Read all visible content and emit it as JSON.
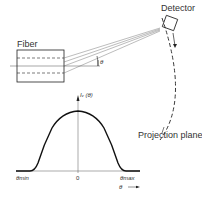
{
  "diagram": {
    "labels": {
      "fiber": "Fiber",
      "detector": "Detector",
      "projection_plane": "Projection plane",
      "angle_symbol": "θ",
      "intensity_axis": "Iᵥ (θ)",
      "theta_min": "θmin",
      "zero": "0",
      "theta_max": "θmax",
      "theta_axis": "θ"
    },
    "colors": {
      "line": "#222222",
      "background": "#ffffff"
    }
  }
}
